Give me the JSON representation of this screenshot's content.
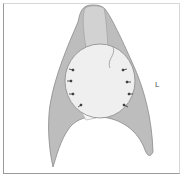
{
  "diagram": {
    "type": "anatomical-schematic",
    "labels": {
      "right_label": "L"
    },
    "colors": {
      "lung_fill": "#bdbdbd",
      "lung_stroke": "#8a8a8a",
      "mass_fill": "#efefef",
      "arrow": "#333333",
      "frame": "#9a9a9a"
    },
    "arrow_count": 8
  }
}
